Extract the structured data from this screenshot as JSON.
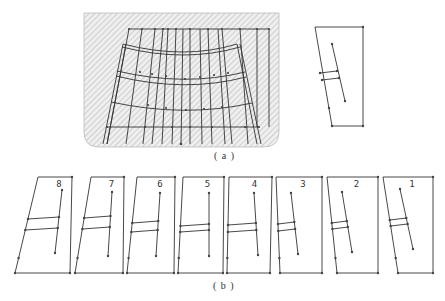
{
  "figure": {
    "part_a": {
      "caption": "( a )",
      "mesh_description": "hatched cross-section with curved grid mesh",
      "inset_description": "single isolated element outline"
    },
    "part_b": {
      "caption": "( b )",
      "panels": [
        {
          "label": "8",
          "top": [
            38,
            72
          ],
          "bottom": [
            15,
            70
          ],
          "inner": {
            "top": [
              62,
              190
            ],
            "bot": [
              55,
              253
            ],
            "rungY": [
              219,
              230
            ],
            "rungL": 28
          }
        },
        {
          "label": "7",
          "top": [
            91,
            124
          ],
          "bottom": [
            75,
            123
          ],
          "inner": {
            "top": [
              112,
              192
            ],
            "bot": [
              108,
              256
            ],
            "rungY": [
              218,
              229
            ],
            "rungL": 83
          }
        },
        {
          "label": "6",
          "top": [
            137,
            175
          ],
          "bottom": [
            127,
            174
          ],
          "inner": {
            "top": [
              160,
              193
            ],
            "bot": [
              156,
              256
            ],
            "rungY": [
              223,
              232
            ],
            "rungL": 132
          }
        },
        {
          "label": "5",
          "top": [
            183,
            224
          ],
          "bottom": [
            178,
            223
          ],
          "inner": {
            "top": [
              209,
              193
            ],
            "bot": [
              209,
              256
            ],
            "rungY": [
              226,
              232
            ],
            "rungL": 181
          }
        },
        {
          "label": "4",
          "top": [
            229,
            272
          ],
          "bottom": [
            227,
            270
          ],
          "inner": {
            "top": [
              254,
              193
            ],
            "bot": [
              258,
              255
            ],
            "rungY": [
              225,
              232
            ],
            "rungL": 228
          }
        },
        {
          "label": "3",
          "top": [
            276,
            322
          ],
          "bottom": [
            280,
            322
          ],
          "inner": {
            "top": [
              291,
              193
            ],
            "bot": [
              298,
              254
            ],
            "rungY": [
              224,
              231
            ],
            "rungL": 277
          }
        },
        {
          "label": "2",
          "top": [
            327,
            378
          ],
          "bottom": [
            337,
            378
          ],
          "inner": {
            "top": [
              342,
              192
            ],
            "bot": [
              352,
              252
            ],
            "rungY": [
              223,
              229
            ],
            "rungL": 331
          }
        },
        {
          "label": "1",
          "top": [
            383,
            433
          ],
          "bottom": [
            398,
            433
          ],
          "inner": {
            "top": [
              400,
              189
            ],
            "bot": [
              413,
              249
            ],
            "rungY": [
              220,
              226
            ],
            "rungL": 390
          }
        }
      ]
    }
  }
}
